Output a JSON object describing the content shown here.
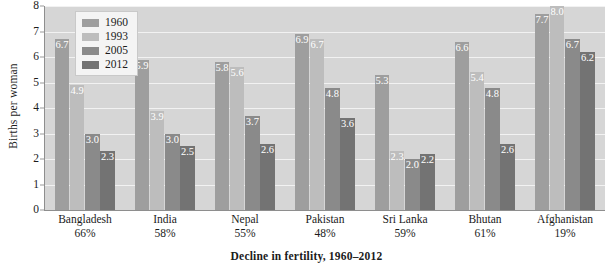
{
  "chart_data": {
    "type": "bar",
    "title": "",
    "xlabel": "Decline in fertility, 1960–2012",
    "ylabel": "Births per woman",
    "ylim": [
      0,
      8
    ],
    "yticks": [
      "0",
      "1",
      "2",
      "3",
      "4",
      "5",
      "6",
      "7",
      "8"
    ],
    "grid": "horizontal",
    "legend_position": "upper-left-inside",
    "categories": [
      "Bangladesh",
      "India",
      "Nepal",
      "Pakistan",
      "Sri Lanka",
      "Bhutan",
      "Afghanistan"
    ],
    "category_sublabels": [
      "66%",
      "58%",
      "55%",
      "48%",
      "59%",
      "61%",
      "19%"
    ],
    "series": [
      {
        "name": "1960",
        "color": "#9e9e9e",
        "values": [
          6.7,
          5.9,
          5.8,
          6.9,
          5.3,
          6.6,
          7.7
        ],
        "labels": [
          "6.7",
          "5.9",
          "5.8",
          "6.9",
          "5.3",
          "6.6",
          "7.7"
        ]
      },
      {
        "name": "1993",
        "color": "#bdbdbd",
        "values": [
          4.9,
          3.9,
          5.6,
          6.7,
          2.3,
          5.4,
          8.0
        ],
        "labels": [
          "4.9",
          "3.9",
          "5.6",
          "6.7",
          "2.3",
          "5.4",
          "8.0"
        ]
      },
      {
        "name": "2005",
        "color": "#8a8a8a",
        "values": [
          3.0,
          3.0,
          3.7,
          4.8,
          2.0,
          4.8,
          6.7
        ],
        "labels": [
          "3.0",
          "3.0",
          "3.7",
          "4.8",
          "2.0",
          "4.8",
          "6.7"
        ]
      },
      {
        "name": "2012",
        "color": "#737373",
        "values": [
          2.3,
          2.5,
          2.6,
          3.6,
          2.2,
          2.6,
          6.2
        ],
        "labels": [
          "2.3",
          "2.5",
          "2.6",
          "3.6",
          "2.2",
          "2.6",
          "6.2"
        ]
      }
    ],
    "plot_background": "#d6d6d6",
    "gridline_color": "#f2f2f2",
    "axis_color": "#8e8e8e",
    "bar_label_color": "#ffffff"
  }
}
